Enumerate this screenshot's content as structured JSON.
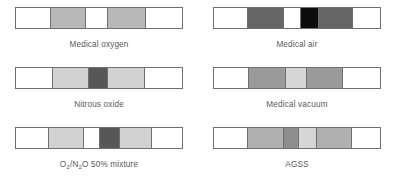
{
  "figure": {
    "colors": {
      "white": "#ffffff",
      "light_gray": "#d9d9d9",
      "gray": "#bdbdbd",
      "medium_gray": "#a6a6a6",
      "dark_gray": "#6e6f71",
      "very_dark_gray": "#58595b",
      "black": "#000000",
      "outline": "#6e6f71",
      "text": "#58595b"
    },
    "bars": [
      {
        "id": "medical-oxygen",
        "label": "Medical oxygen",
        "label_html": "Medical oxygen",
        "segments": [
          {
            "name": "band-1",
            "color": "#ffffff",
            "width": 21.0
          },
          {
            "name": "band-2",
            "color": "#b8b8b8",
            "width": 21.0
          },
          {
            "name": "band-3",
            "color": "#ffffff",
            "width": 13.5
          },
          {
            "name": "band-4",
            "color": "#b8b8b8",
            "width": 23.0
          },
          {
            "name": "band-5",
            "color": "#ffffff",
            "width": 21.5
          }
        ]
      },
      {
        "id": "medical-air",
        "label": "Medical air",
        "label_html": "Medical air",
        "segments": [
          {
            "name": "band-1",
            "color": "#ffffff",
            "width": 20.5
          },
          {
            "name": "band-2",
            "color": "#666668",
            "width": 21.5
          },
          {
            "name": "band-3",
            "color": "#ffffff",
            "width": 10.5
          },
          {
            "name": "band-4",
            "color": "#0d0d0d",
            "width": 11.0
          },
          {
            "name": "band-5",
            "color": "#666668",
            "width": 20.5
          },
          {
            "name": "band-6",
            "color": "#ffffff",
            "width": 16.0
          }
        ]
      },
      {
        "id": "nitrous-oxide",
        "label": "Nitrous oxide",
        "label_html": "Nitrous oxide",
        "segments": [
          {
            "name": "band-1",
            "color": "#ffffff",
            "width": 22.0
          },
          {
            "name": "band-2",
            "color": "#d2d2d2",
            "width": 22.0
          },
          {
            "name": "band-3",
            "color": "#575758",
            "width": 11.5
          },
          {
            "name": "band-4",
            "color": "#d2d2d2",
            "width": 22.0
          },
          {
            "name": "band-5",
            "color": "#ffffff",
            "width": 22.5
          }
        ]
      },
      {
        "id": "medical-vacuum",
        "label": "Medical vacuum",
        "label_html": "Medical vacuum",
        "segments": [
          {
            "name": "band-1",
            "color": "#ffffff",
            "width": 21.0
          },
          {
            "name": "band-2",
            "color": "#9a9a9b",
            "width": 22.5
          },
          {
            "name": "band-3",
            "color": "#d6d6d6",
            "width": 12.5
          },
          {
            "name": "band-4",
            "color": "#9a9a9b",
            "width": 22.0
          },
          {
            "name": "band-5",
            "color": "#ffffff",
            "width": 22.0
          }
        ]
      },
      {
        "id": "o2-n2o-mixture",
        "label": "O2/N2O 50% mixture",
        "label_html": "O<sub>2</sub>/N<sub>2</sub>O 50% mixture",
        "segments": [
          {
            "name": "band-1",
            "color": "#ffffff",
            "width": 20.0
          },
          {
            "name": "band-2",
            "color": "#d2d2d2",
            "width": 21.0
          },
          {
            "name": "band-3",
            "color": "#ffffff",
            "width": 9.5
          },
          {
            "name": "band-4",
            "color": "#575758",
            "width": 12.0
          },
          {
            "name": "band-5",
            "color": "#d2d2d2",
            "width": 19.5
          },
          {
            "name": "band-6",
            "color": "#ffffff",
            "width": 18.0
          }
        ]
      },
      {
        "id": "agss",
        "label": "AGSS",
        "label_html": "AGSS",
        "segments": [
          {
            "name": "band-1",
            "color": "#ffffff",
            "width": 20.5
          },
          {
            "name": "band-2",
            "color": "#b0b0b0",
            "width": 21.5
          },
          {
            "name": "band-3",
            "color": "#8e8e8f",
            "width": 9.0
          },
          {
            "name": "band-4",
            "color": "#d6d6d6",
            "width": 11.0
          },
          {
            "name": "band-5",
            "color": "#b0b0b0",
            "width": 21.0
          },
          {
            "name": "band-6",
            "color": "#ffffff",
            "width": 17.0
          }
        ]
      }
    ]
  }
}
